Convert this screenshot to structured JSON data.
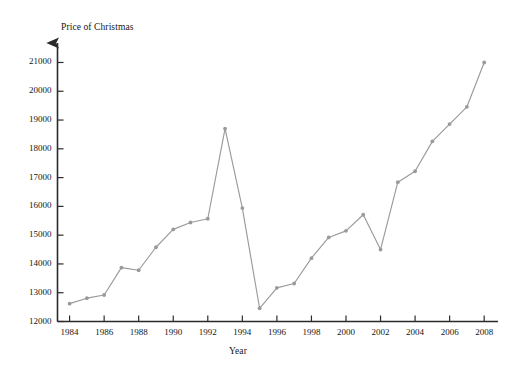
{
  "chart_data": {
    "type": "line",
    "title": "",
    "xlabel": "Year",
    "ylabel": "Price of Christmas",
    "x": [
      1984,
      1985,
      1986,
      1987,
      1988,
      1989,
      1990,
      1991,
      1992,
      1993,
      1994,
      1995,
      1996,
      1997,
      1998,
      1999,
      2000,
      2001,
      2002,
      2003,
      2004,
      2005,
      2006,
      2007,
      2008
    ],
    "values": [
      12620,
      12810,
      12920,
      13870,
      13780,
      14580,
      15200,
      15440,
      15570,
      18700,
      15940,
      12460,
      13170,
      13320,
      14200,
      14920,
      15150,
      15710,
      14500,
      16840,
      17220,
      18260,
      18860,
      19460,
      21000
    ],
    "series": [
      {
        "name": "Price of Christmas",
        "values": [
          12620,
          12810,
          12920,
          13870,
          13780,
          14580,
          15200,
          15440,
          15570,
          18700,
          15940,
          12460,
          13170,
          13320,
          14200,
          14920,
          15150,
          15710,
          14500,
          16840,
          17220,
          18260,
          18860,
          19460,
          21000
        ]
      }
    ],
    "xlim": [
      1983.3,
      2008.8
    ],
    "ylim": [
      12000,
      21450
    ],
    "ytick_labels": [
      "12000",
      "13000",
      "14000",
      "15000",
      "16000",
      "17000",
      "18000",
      "19000",
      "20000",
      "21000"
    ],
    "ytick_values": [
      12000,
      13000,
      14000,
      15000,
      16000,
      17000,
      18000,
      19000,
      20000,
      21000
    ],
    "xtick_labels": [
      "1984",
      "1986",
      "1988",
      "1990",
      "1992",
      "1994",
      "1996",
      "1998",
      "2000",
      "2002",
      "2004",
      "2006",
      "2008"
    ],
    "xtick_values": [
      1984,
      1986,
      1988,
      1990,
      1992,
      1994,
      1996,
      1998,
      2000,
      2002,
      2004,
      2006,
      2008
    ],
    "grid": false,
    "legend": "none",
    "line_color": "#9a9a9a",
    "marker_color": "#9a9a9a",
    "axis_color": "#2b2b2b",
    "background": "#ffffff"
  }
}
